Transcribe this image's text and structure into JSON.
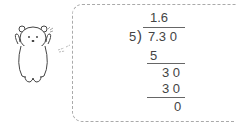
{
  "division": {
    "quotient": "1.6",
    "divisor": "5",
    "dividend": "7.3 0",
    "step1": "5",
    "step2": "3 0",
    "step3": "3 0",
    "remainder": "0"
  },
  "character": "polar-bear"
}
